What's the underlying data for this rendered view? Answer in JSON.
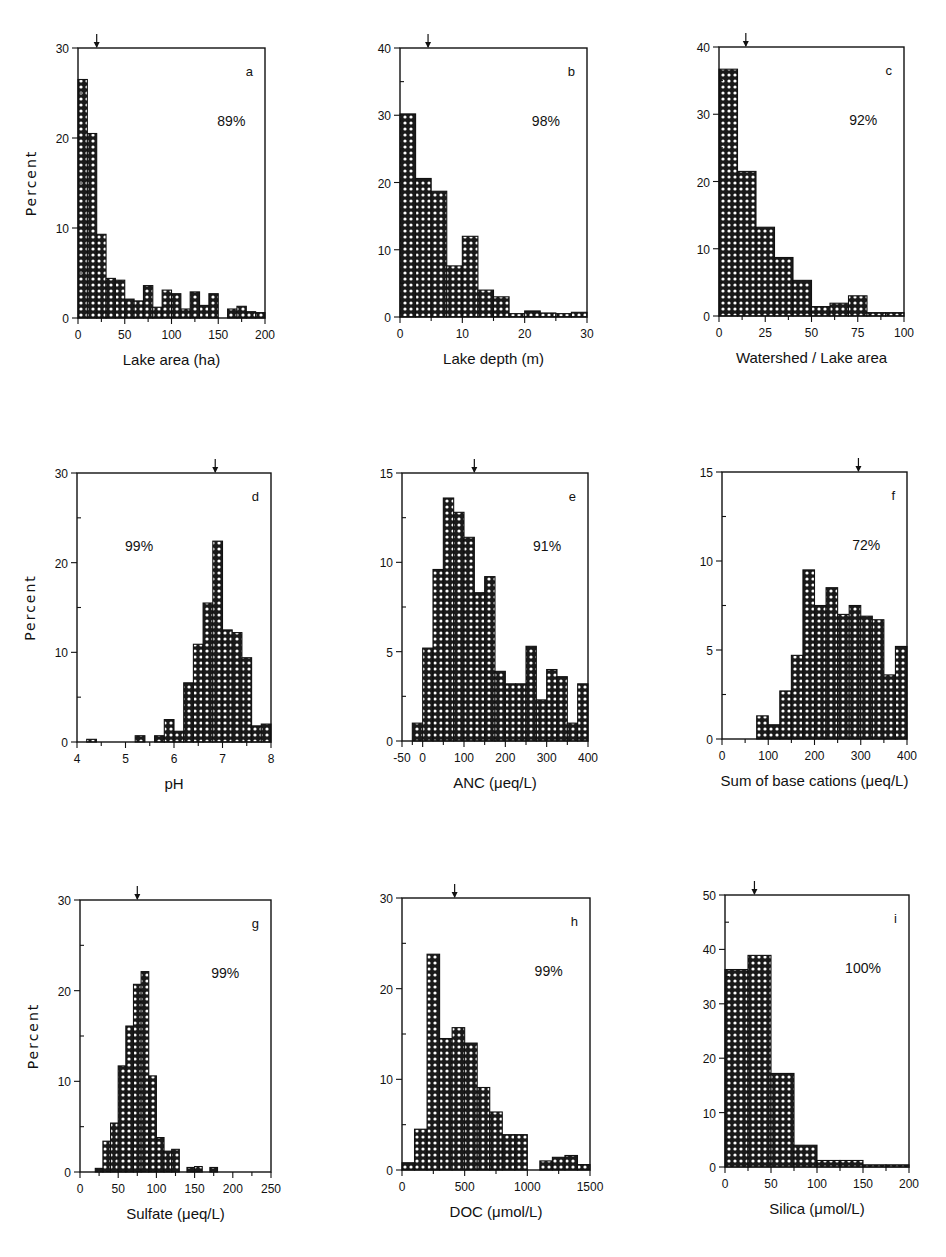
{
  "chart_data": [
    {
      "panel": "a",
      "type": "bar",
      "title": "",
      "xlabel": "Lake area (ha)",
      "ylabel": "Percent",
      "annotation": "89%",
      "xlim": [
        0,
        200
      ],
      "ylim": [
        0,
        30
      ],
      "xticks": [
        0,
        50,
        100,
        150,
        200
      ],
      "yticks": [
        0,
        10,
        20,
        30
      ],
      "yminor": 5,
      "bin_edges_start": 0,
      "bin_width": 10,
      "values": [
        26.5,
        20.5,
        9.3,
        4.4,
        4.2,
        2.1,
        1.9,
        3.6,
        1.2,
        3.1,
        2.7,
        1.0,
        2.9,
        1.4,
        2.7,
        0,
        1.0,
        1.3,
        0.7,
        0.6
      ],
      "median_arrow": 20,
      "frame": {
        "left": 78,
        "right": 265,
        "top": 48,
        "bottom": 318
      }
    },
    {
      "panel": "b",
      "type": "bar",
      "title": "",
      "xlabel": "Lake depth (m)",
      "ylabel": "",
      "annotation": "98%",
      "xlim": [
        0,
        30
      ],
      "ylim": [
        0,
        40
      ],
      "xticks": [
        0,
        10,
        20,
        30
      ],
      "yticks": [
        0,
        10,
        20,
        30,
        40
      ],
      "yminor": 5,
      "bin_edges_start": 0,
      "bin_width": 2.5,
      "values": [
        30.2,
        20.6,
        18.7,
        7.6,
        12.0,
        4.0,
        3.0,
        0.5,
        0.9,
        0.6,
        0.5,
        0.7
      ],
      "median_arrow": 4.5,
      "frame": {
        "left": 400,
        "right": 587,
        "top": 48,
        "bottom": 317
      }
    },
    {
      "panel": "c",
      "type": "bar",
      "title": "",
      "xlabel": "Watershed / Lake area",
      "ylabel": "",
      "annotation": "92%",
      "xlim": [
        0,
        100
      ],
      "ylim": [
        0,
        40
      ],
      "xticks": [
        0,
        25,
        50,
        75,
        100
      ],
      "yticks": [
        0,
        10,
        20,
        30,
        40
      ],
      "yminor": 5,
      "bin_edges_start": 0,
      "bin_width": 10,
      "values": [
        36.7,
        21.5,
        13.2,
        8.7,
        5.3,
        1.4,
        1.9,
        3.0,
        0.5,
        0.5
      ],
      "median_arrow": 14.5,
      "frame": {
        "left": 719,
        "right": 904,
        "top": 47,
        "bottom": 316
      }
    },
    {
      "panel": "d",
      "type": "bar",
      "title": "",
      "xlabel": "pH",
      "ylabel": "Percent",
      "annotation": "99%",
      "xlim": [
        4,
        8
      ],
      "ylim": [
        0,
        30
      ],
      "xticks": [
        4,
        5,
        6,
        7,
        8
      ],
      "yticks": [
        0,
        10,
        20,
        30
      ],
      "yminor": 5,
      "bin_edges_start": 4.0,
      "bin_width": 0.2,
      "values": [
        0,
        0.3,
        0,
        0,
        0,
        0,
        0.7,
        0,
        0.7,
        2.5,
        1.2,
        6.6,
        10.9,
        15.5,
        22.4,
        12.5,
        12.2,
        9.4,
        1.8,
        2.0
      ],
      "median_arrow": 6.85,
      "frame": {
        "left": 77,
        "right": 271,
        "top": 473,
        "bottom": 742
      }
    },
    {
      "panel": "e",
      "type": "bar",
      "title": "",
      "xlabel": "ANC (μeq/L)",
      "ylabel": "",
      "annotation": "91%",
      "xlim": [
        -50,
        400
      ],
      "ylim": [
        0,
        15
      ],
      "xticks": [
        -50,
        0,
        100,
        200,
        300,
        400
      ],
      "yticks": [
        0,
        5,
        10,
        15
      ],
      "yminor": 2.5,
      "bin_edges_start": -25,
      "bin_width": 25,
      "values": [
        1.0,
        5.2,
        9.6,
        13.6,
        12.8,
        11.4,
        8.3,
        9.2,
        3.9,
        3.2,
        3.2,
        5.3,
        2.3,
        4.0,
        3.6,
        1.0,
        3.2
      ],
      "median_arrow": 125,
      "frame": {
        "left": 402,
        "right": 588,
        "top": 473,
        "bottom": 741
      }
    },
    {
      "panel": "f",
      "type": "bar",
      "title": "",
      "xlabel": "Sum of base cations (μeq/L)",
      "ylabel": "",
      "annotation": "72%",
      "xlim": [
        0,
        400
      ],
      "ylim": [
        0,
        15
      ],
      "xticks": [
        0,
        100,
        200,
        300,
        400
      ],
      "yticks": [
        0,
        5,
        10,
        15
      ],
      "yminor": 2.5,
      "bin_edges_start": 75,
      "bin_width": 25,
      "values": [
        1.3,
        0.8,
        2.7,
        4.7,
        9.5,
        7.5,
        8.5,
        7.0,
        7.5,
        6.9,
        6.7,
        3.6,
        5.2
      ],
      "median_arrow": 295,
      "frame": {
        "left": 722,
        "right": 907,
        "top": 472,
        "bottom": 739
      }
    },
    {
      "panel": "g",
      "type": "bar",
      "title": "",
      "xlabel": "Sulfate (μeq/L)",
      "ylabel": "Percent",
      "annotation": "99%",
      "xlim": [
        0,
        250
      ],
      "ylim": [
        0,
        30
      ],
      "xticks": [
        0,
        50,
        100,
        150,
        200,
        250
      ],
      "yticks": [
        0,
        10,
        20,
        30
      ],
      "yminor": 5,
      "bin_edges_start": 20,
      "bin_width": 10,
      "values": [
        0.4,
        3.4,
        5.4,
        11.7,
        16.1,
        20.7,
        22.1,
        10.6,
        3.8,
        2.3,
        2.5,
        0,
        0.5,
        0.6,
        0,
        0.5
      ],
      "median_arrow": 75,
      "frame": {
        "left": 80,
        "right": 271,
        "top": 900,
        "bottom": 1172
      }
    },
    {
      "panel": "h",
      "type": "bar",
      "title": "",
      "xlabel": "DOC (μmol/L)",
      "ylabel": "",
      "annotation": "99%",
      "xlim": [
        0,
        1500
      ],
      "ylim": [
        0,
        30
      ],
      "xticks": [
        0,
        500,
        1000,
        1500
      ],
      "yticks": [
        0,
        10,
        20,
        30
      ],
      "yminor": 5,
      "bin_edges_start": 0,
      "bin_width": 100,
      "values": [
        0.8,
        4.5,
        23.8,
        14.5,
        15.7,
        14.0,
        9.1,
        6.4,
        3.9,
        3.9,
        0,
        1.0,
        1.4,
        1.6,
        0.6
      ],
      "median_arrow": 420,
      "frame": {
        "left": 402,
        "right": 590,
        "top": 898,
        "bottom": 1170
      }
    },
    {
      "panel": "i",
      "type": "bar",
      "title": "",
      "xlabel": "Silica (μmol/L)",
      "ylabel": "",
      "annotation": "100%",
      "xlim": [
        0,
        200
      ],
      "ylim": [
        0,
        50
      ],
      "xticks": [
        0,
        50,
        100,
        150,
        200
      ],
      "yticks": [
        0,
        10,
        20,
        30,
        40,
        50
      ],
      "yminor": 5,
      "bin_edges_start": 0,
      "bin_width": 25,
      "values": [
        36.3,
        38.9,
        17.2,
        4.0,
        1.2,
        1.2,
        0.4,
        0.4
      ],
      "median_arrow": 32,
      "frame": {
        "left": 725,
        "right": 909,
        "top": 895,
        "bottom": 1167
      }
    }
  ],
  "colors": {
    "ink": "#111111",
    "background": "#ffffff",
    "dot": "#ffffff"
  }
}
